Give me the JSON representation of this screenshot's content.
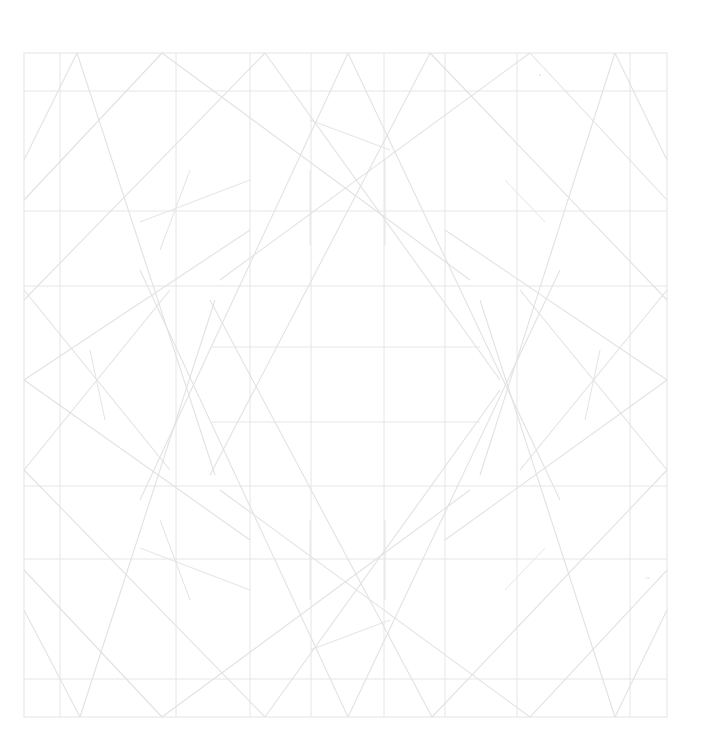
{
  "diagram": {
    "title": "",
    "colors": {
      "background": "#ffffff",
      "line": "#e2e2e2"
    },
    "labels": []
  }
}
